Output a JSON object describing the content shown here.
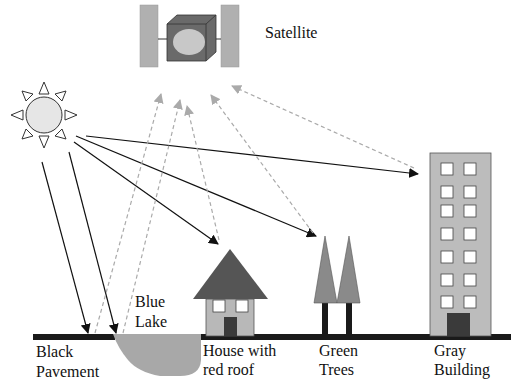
{
  "labels": {
    "satellite": "Satellite",
    "pavement_line1": "Black",
    "pavement_line2": "Pavement",
    "lake_line1": "Blue",
    "lake_line2": "Lake",
    "house_line1": "House with",
    "house_line2": "red roof",
    "trees_line1": "Green",
    "trees_line2": "Trees",
    "building_line1": "Gray",
    "building_line2": "Building"
  },
  "colors": {
    "incident_ray": "#111111",
    "reflected_ray": "#aaaaaa",
    "ground": "#1a1a1a",
    "lake": "#a8a8a8",
    "roof": "#555555",
    "house_wall": "#b8b8b8",
    "door": "#3a3a3a",
    "tree_crown": "#8a8a8a",
    "trunk": "#1a1a1a",
    "building": "#bcbcbc",
    "sun": "#e6e6e6",
    "satellite_panel": "#b0b0b0",
    "satellite_body": "#707070",
    "satellite_dish": "#c8c8c8"
  }
}
